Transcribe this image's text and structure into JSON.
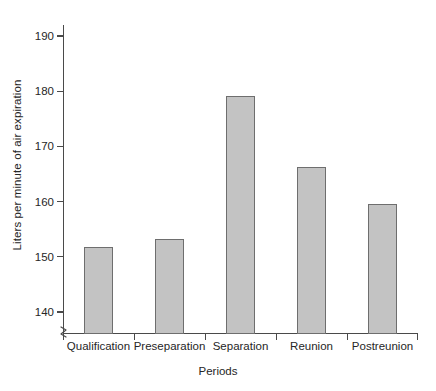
{
  "chart_data": {
    "type": "bar",
    "title": "",
    "xlabel": "Periods",
    "ylabel": "Liters per minute of air expiration",
    "categories": [
      "Qualification",
      "Preseparation",
      "Separation",
      "Reunion",
      "Postreunion"
    ],
    "values": [
      151.8,
      153.2,
      179.2,
      166.2,
      159.5
    ],
    "ylim": [
      136,
      192
    ],
    "yticks": [
      140,
      150,
      160,
      170,
      180,
      190
    ],
    "ytick_labels": [
      "140",
      "150",
      "160",
      "170",
      "180",
      "190"
    ],
    "grid": false,
    "legend": null,
    "axis_break": true,
    "bar_color": "#c3c3c3",
    "bar_edge_color": "#6e6e6e",
    "axis_color": "#4a4a4a"
  }
}
